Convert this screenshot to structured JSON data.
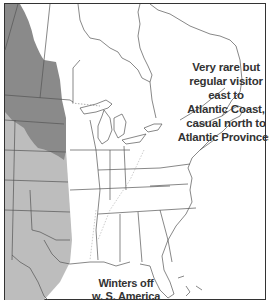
{
  "map": {
    "region": "Eastern and central North America",
    "legend_colors": {
      "breeding": "#8a8a8a",
      "migration": "#bdbdbd",
      "background": "#ffffff",
      "borders": "#555555",
      "frame": "#333333"
    },
    "annotations": {
      "northeast": {
        "lines": [
          "Very rare but",
          "regular visitor",
          "east to",
          "Atlantic Coast,",
          "casual north to",
          "Atlantic Provinces"
        ]
      },
      "winter": {
        "lines": [
          "Winters off",
          "w. S. America"
        ]
      }
    }
  }
}
